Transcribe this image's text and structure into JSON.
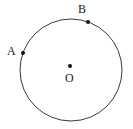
{
  "figure": {
    "type": "circle-diagram",
    "width": 133,
    "height": 129,
    "background_color": "#ffffff",
    "stroke_color": "#3a3a3a",
    "point_color": "#111111",
    "label_color": "#1a1a1a",
    "circle": {
      "name": "circle-outline",
      "center_x": 71,
      "center_y": 70,
      "radius": 51,
      "stroke_width": 1
    },
    "points": [
      {
        "id": "A",
        "label": "A",
        "name": "point-a",
        "x": 23,
        "y": 53,
        "radius": 2,
        "label_x": 7,
        "label_y": 45,
        "on_circle": true
      },
      {
        "id": "B",
        "label": "B",
        "name": "point-b",
        "x": 88,
        "y": 22,
        "radius": 2,
        "label_x": 78,
        "label_y": 3,
        "on_circle": true
      },
      {
        "id": "O",
        "label": "O",
        "name": "point-o-center",
        "x": 70,
        "y": 66,
        "radius": 2,
        "label_x": 65,
        "label_y": 72,
        "on_circle": false
      }
    ]
  }
}
